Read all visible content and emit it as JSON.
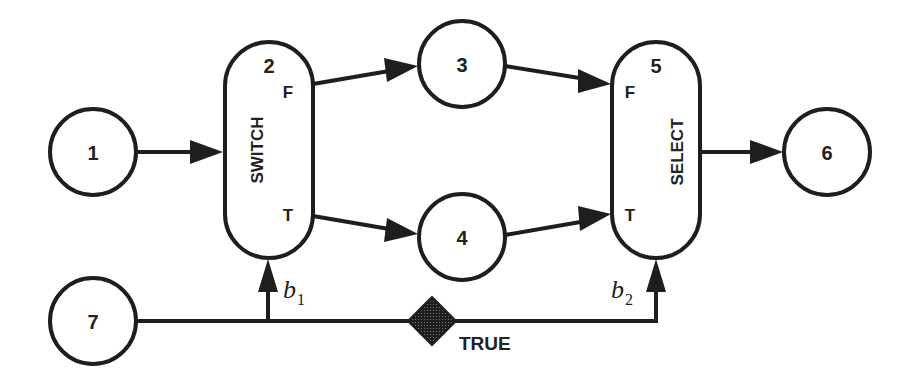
{
  "diagram": {
    "type": "dataflow-graph",
    "nodes": [
      {
        "id": "1",
        "label": "1",
        "shape": "circle"
      },
      {
        "id": "2",
        "label": "2",
        "shape": "pill",
        "operator": "SWITCH",
        "ports": {
          "false": "F",
          "true": "T"
        }
      },
      {
        "id": "3",
        "label": "3",
        "shape": "circle"
      },
      {
        "id": "4",
        "label": "4",
        "shape": "circle"
      },
      {
        "id": "5",
        "label": "5",
        "shape": "pill",
        "operator": "SELECT",
        "ports": {
          "false": "F",
          "true": "T"
        }
      },
      {
        "id": "6",
        "label": "6",
        "shape": "circle"
      },
      {
        "id": "7",
        "label": "7",
        "shape": "circle"
      }
    ],
    "edges": [
      {
        "from": "1",
        "to": "2"
      },
      {
        "from": "2",
        "to": "3",
        "port": "F"
      },
      {
        "from": "2",
        "to": "4",
        "port": "T"
      },
      {
        "from": "3",
        "to": "5",
        "port": "F"
      },
      {
        "from": "4",
        "to": "5",
        "port": "T"
      },
      {
        "from": "5",
        "to": "6"
      },
      {
        "from": "7",
        "to": "2",
        "label": "b",
        "subscript": "1"
      },
      {
        "from": "7",
        "to": "5",
        "label": "b",
        "subscript": "2"
      }
    ],
    "control": {
      "b1": {
        "base": "b",
        "sub": "1"
      },
      "b2": {
        "base": "b",
        "sub": "2"
      }
    },
    "initial_token": {
      "shape": "diamond",
      "label": "TRUE"
    }
  }
}
